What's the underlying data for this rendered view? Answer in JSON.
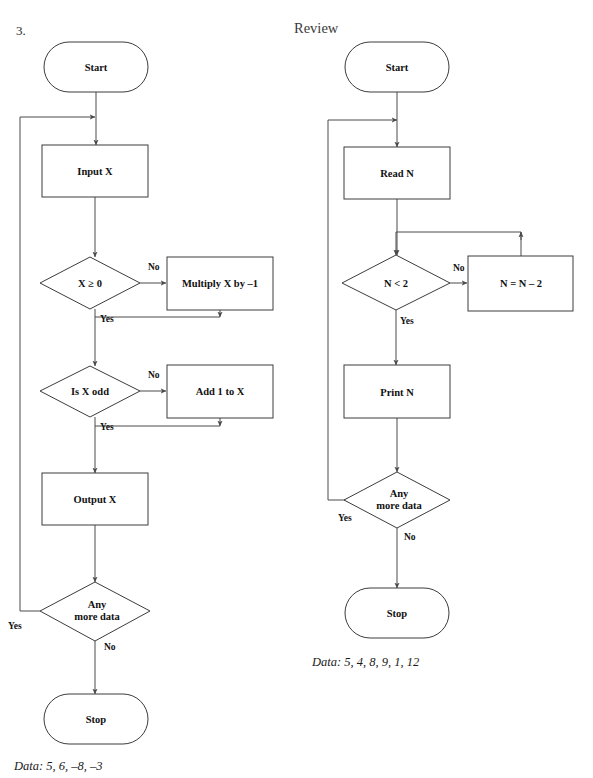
{
  "page": {
    "question_number": "3.",
    "section_title": "Review",
    "width": 593,
    "height": 778,
    "background": "#ffffff",
    "stroke_color": "#3c3c3c",
    "text_color": "#111111"
  },
  "flowcharts": [
    {
      "id": "left-flowchart",
      "caption": "Data: 5, 6, –8, –3",
      "nodes": [
        {
          "id": "start",
          "type": "terminator",
          "label": "Start",
          "cx": 96,
          "cy": 67,
          "w": 104,
          "h": 50
        },
        {
          "id": "input-x",
          "type": "process",
          "label": "Input X",
          "cx": 95,
          "cy": 171,
          "w": 106,
          "h": 52
        },
        {
          "id": "x-ge-0",
          "type": "decision",
          "label": "X ≥ 0",
          "cx": 90,
          "cy": 283,
          "w": 100,
          "h": 52
        },
        {
          "id": "multiply",
          "type": "process",
          "label": "Multiply X by –1",
          "cx": 220,
          "cy": 283,
          "w": 105,
          "h": 53
        },
        {
          "id": "is-x-odd",
          "type": "decision",
          "label": "Is X odd",
          "cx": 90,
          "cy": 391,
          "w": 100,
          "h": 52
        },
        {
          "id": "add-1",
          "type": "process",
          "label": "Add 1 to X",
          "cx": 220,
          "cy": 391,
          "w": 105,
          "h": 53
        },
        {
          "id": "output-x",
          "type": "process",
          "label": "Output X",
          "cx": 95,
          "cy": 499,
          "w": 106,
          "h": 52
        },
        {
          "id": "any-more",
          "type": "decision",
          "label": "Any\nmore data",
          "cx": 95,
          "cy": 611,
          "w": 110,
          "h": 60
        },
        {
          "id": "stop",
          "type": "terminator",
          "label": "Stop",
          "cx": 96,
          "cy": 719,
          "w": 104,
          "h": 50
        }
      ],
      "branch_labels": [
        {
          "id": "no-x-ge-0",
          "text": "No",
          "x": 148,
          "y": 270
        },
        {
          "id": "yes-x-ge-0",
          "text": "Yes",
          "x": 100,
          "y": 320
        },
        {
          "id": "no-is-x-odd",
          "text": "No",
          "x": 148,
          "y": 374
        },
        {
          "id": "yes-is-odd",
          "text": "Yes",
          "x": 100,
          "y": 428
        },
        {
          "id": "yes-any-more",
          "text": "Yes",
          "x": 16,
          "y": 627
        },
        {
          "id": "no-any-more",
          "text": "No",
          "x": 105,
          "y": 648
        }
      ]
    },
    {
      "id": "right-flowchart",
      "caption": "Data: 5, 4, 8, 9, 1, 12",
      "nodes": [
        {
          "id": "start",
          "type": "terminator",
          "label": "Start",
          "cx": 397,
          "cy": 67,
          "w": 104,
          "h": 50
        },
        {
          "id": "read-n",
          "type": "process",
          "label": "Read N",
          "cx": 397,
          "cy": 173,
          "w": 106,
          "h": 52
        },
        {
          "id": "n-lt-2",
          "type": "decision",
          "label": "N < 2",
          "cx": 396,
          "cy": 283,
          "w": 108,
          "h": 55
        },
        {
          "id": "n-eq-n-2",
          "type": "process",
          "label": "N = N – 2",
          "cx": 521,
          "cy": 283,
          "w": 105,
          "h": 55
        },
        {
          "id": "print-n",
          "type": "process",
          "label": "Print N",
          "cx": 397,
          "cy": 391,
          "w": 106,
          "h": 53
        },
        {
          "id": "any-more",
          "type": "decision",
          "label": "Any\nmore data",
          "cx": 397,
          "cy": 500,
          "w": 106,
          "h": 56
        },
        {
          "id": "stop",
          "type": "terminator",
          "label": "Stop",
          "cx": 397,
          "cy": 613,
          "w": 104,
          "h": 50
        }
      ],
      "branch_labels": [
        {
          "id": "no-n-lt-2",
          "text": "No",
          "x": 455,
          "y": 270
        },
        {
          "id": "yes-n-lt-2",
          "text": "Yes",
          "x": 404,
          "y": 322
        },
        {
          "id": "yes-any-more",
          "text": "Yes",
          "x": 346,
          "y": 518
        },
        {
          "id": "no-any-more",
          "text": "No",
          "x": 406,
          "y": 538
        }
      ]
    }
  ]
}
